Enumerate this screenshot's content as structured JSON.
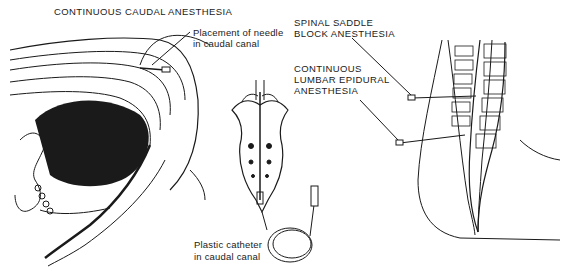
{
  "figure": {
    "panels": [
      {
        "id": "caudal",
        "title": "CONTINUOUS CAUDAL ANESTHESIA",
        "callout": [
          "Placement of needle",
          "in caudal canal"
        ]
      },
      {
        "id": "sacrum",
        "callout": [
          "Plastic catheter",
          "in caudal canal"
        ]
      },
      {
        "id": "spinal",
        "callouts": [
          [
            "SPINAL SADDLE",
            "BLOCK ANESTHESIA"
          ],
          [
            "CONTINUOUS",
            "LUMBAR EPIDURAL",
            "ANESTHESIA"
          ]
        ]
      }
    ],
    "colors": {
      "ink": "#1a1a1a",
      "background": "#ffffff"
    }
  }
}
